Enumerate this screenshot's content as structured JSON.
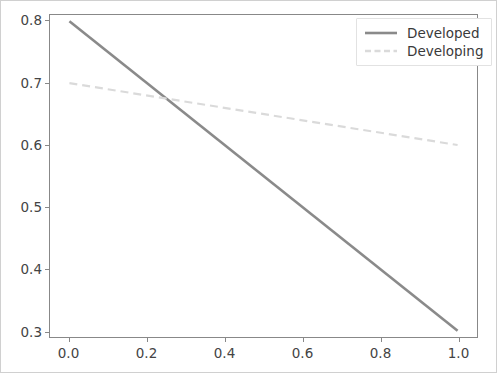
{
  "chart_data": {
    "type": "line",
    "title": "",
    "xlabel": "",
    "ylabel": "",
    "xlim": [
      -0.05,
      1.05
    ],
    "ylim": [
      0.29,
      0.81
    ],
    "xticks": [
      "0.0",
      "0.2",
      "0.4",
      "0.6",
      "0.8",
      "1.0"
    ],
    "xtick_values": [
      0.0,
      0.2,
      0.4,
      0.6,
      0.8,
      1.0
    ],
    "yticks": [
      "0.3",
      "0.4",
      "0.5",
      "0.6",
      "0.7",
      "0.8"
    ],
    "ytick_values": [
      0.3,
      0.4,
      0.5,
      0.6,
      0.7,
      0.8
    ],
    "grid": false,
    "legend_position": "upper right",
    "x": [
      0.0,
      1.0
    ],
    "series": [
      {
        "name": "Developed",
        "values": [
          0.8,
          0.3
        ],
        "color": "#8a8a8a",
        "linestyle": "solid",
        "linewidth": 2.6
      },
      {
        "name": "Developing",
        "values": [
          0.7,
          0.6
        ],
        "color": "#dadada",
        "linestyle": "dashed",
        "linewidth": 2.2
      }
    ],
    "annotations": []
  },
  "legend": {
    "entries": [
      {
        "label": "Developed"
      },
      {
        "label": "Developing"
      }
    ]
  },
  "colors": {
    "figure_border": "#d0d0d0",
    "axes_spine": "#888888",
    "tick_text": "#444444",
    "legend_border": "#e2e2e2",
    "background": "#ffffff"
  }
}
